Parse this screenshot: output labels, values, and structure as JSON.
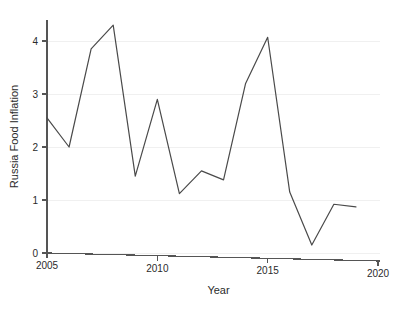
{
  "chart_data": {
    "type": "line",
    "title": "",
    "xlabel": "Year",
    "ylabel": "Russia Food Inflation",
    "xlim": [
      2005,
      2020
    ],
    "ylim": [
      0,
      4.45
    ],
    "grid": true,
    "legend": null,
    "xticks": [
      2005,
      2010,
      2015,
      2020
    ],
    "xtick_labels": [
      "2005",
      "2010",
      "2015",
      "2020"
    ],
    "yticks": [
      0,
      1,
      2,
      3,
      4
    ],
    "ytick_labels": [
      "0",
      "1",
      "2",
      "3",
      "4"
    ],
    "series": [
      {
        "name": "Russia Food Inflation",
        "color": "#4a4a4a",
        "x": [
          2005,
          2006,
          2007,
          2008,
          2009,
          2010,
          2011,
          2012,
          2013,
          2014,
          2015,
          2016,
          2017,
          2018,
          2019
        ],
        "values": [
          2.55,
          2.0,
          3.85,
          4.3,
          1.45,
          2.9,
          1.12,
          1.55,
          1.38,
          3.2,
          4.07,
          1.15,
          0.15,
          0.92,
          0.87
        ]
      }
    ]
  },
  "axes": {
    "x_title": "Year",
    "y_title": "Russia Food Inflation"
  }
}
